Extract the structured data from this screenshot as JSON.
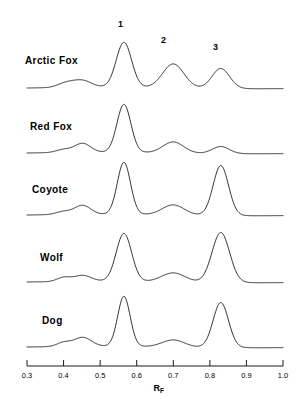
{
  "figure": {
    "axis_title_main": "R",
    "axis_title_sub": "F",
    "peak_labels": [
      {
        "text": "1",
        "rf": 0.565,
        "x": 118,
        "y": 20
      },
      {
        "text": "2",
        "rf": 0.7,
        "x": 161,
        "y": 36
      },
      {
        "text": "3",
        "rf": 0.83,
        "x": 213,
        "y": 43
      }
    ]
  },
  "chart_data": {
    "type": "line",
    "title": "",
    "xlabel": "R_F",
    "ylabel": "",
    "xlim": [
      0.3,
      1.0
    ],
    "grid": false,
    "legend": "none",
    "tick_labels": [
      "0.3",
      "0.4",
      "0.5",
      "0.6",
      "0.7",
      "0.8",
      "0.9",
      "1.0"
    ],
    "ticks": [
      0.3,
      0.4,
      0.5,
      0.6,
      0.7,
      0.8,
      0.9,
      1.0
    ],
    "annotated_peaks": [
      {
        "label": "1",
        "rf": 0.565
      },
      {
        "label": "2",
        "rf": 0.7
      },
      {
        "label": "3",
        "rf": 0.83
      }
    ],
    "series": [
      {
        "name": "Arctic Fox",
        "baseline_y": 88,
        "label_x": 25,
        "label_y": 56,
        "peaks": [
          {
            "rf": 0.405,
            "height": 4,
            "width": 0.022
          },
          {
            "rf": 0.45,
            "height": 7,
            "width": 0.026
          },
          {
            "rf": 0.565,
            "height": 45,
            "width": 0.021
          },
          {
            "rf": 0.7,
            "height": 24,
            "width": 0.029
          },
          {
            "rf": 0.83,
            "height": 20,
            "width": 0.024
          }
        ]
      },
      {
        "name": "Red Fox",
        "baseline_y": 153,
        "label_x": 30,
        "label_y": 122,
        "peaks": [
          {
            "rf": 0.4,
            "height": 3,
            "width": 0.02
          },
          {
            "rf": 0.452,
            "height": 9,
            "width": 0.022
          },
          {
            "rf": 0.565,
            "height": 48,
            "width": 0.019
          },
          {
            "rf": 0.7,
            "height": 11,
            "width": 0.028
          },
          {
            "rf": 0.83,
            "height": 7,
            "width": 0.023
          }
        ]
      },
      {
        "name": "Coyote",
        "baseline_y": 215,
        "label_x": 32,
        "label_y": 185,
        "peaks": [
          {
            "rf": 0.4,
            "height": 3,
            "width": 0.02
          },
          {
            "rf": 0.452,
            "height": 9,
            "width": 0.022
          },
          {
            "rf": 0.565,
            "height": 52,
            "width": 0.018
          },
          {
            "rf": 0.7,
            "height": 10,
            "width": 0.03
          },
          {
            "rf": 0.83,
            "height": 50,
            "width": 0.021
          }
        ]
      },
      {
        "name": "Wolf",
        "baseline_y": 282,
        "label_x": 40,
        "label_y": 253,
        "peaks": [
          {
            "rf": 0.4,
            "height": 4,
            "width": 0.018
          },
          {
            "rf": 0.452,
            "height": 6,
            "width": 0.024
          },
          {
            "rf": 0.565,
            "height": 48,
            "width": 0.021
          },
          {
            "rf": 0.7,
            "height": 9,
            "width": 0.032
          },
          {
            "rf": 0.83,
            "height": 50,
            "width": 0.024
          }
        ]
      },
      {
        "name": "Dog",
        "baseline_y": 347,
        "label_x": 42,
        "label_y": 316,
        "peaks": [
          {
            "rf": 0.4,
            "height": 4,
            "width": 0.018
          },
          {
            "rf": 0.452,
            "height": 9,
            "width": 0.024
          },
          {
            "rf": 0.565,
            "height": 50,
            "width": 0.017
          },
          {
            "rf": 0.7,
            "height": 7,
            "width": 0.03
          },
          {
            "rf": 0.83,
            "height": 45,
            "width": 0.021
          }
        ]
      }
    ]
  },
  "axis": {
    "line_y": 366,
    "x_left_px": 27,
    "x_right_px": 283,
    "tick_len": 6,
    "label_y": 372,
    "title_y": 384
  },
  "colors": {
    "trace": "#1a1a1a",
    "axis": "#1a1a1a",
    "background": "#ffffff"
  }
}
